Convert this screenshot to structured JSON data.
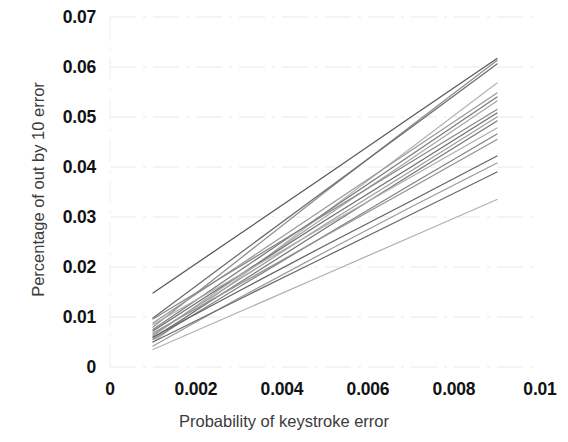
{
  "chart_data": {
    "type": "line",
    "title": "",
    "xlabel": "Probability of keystroke error",
    "ylabel": "Percentage of out by 10 error",
    "xlim": [
      0,
      0.01
    ],
    "ylim": [
      0,
      0.07
    ],
    "xticks": [
      "0",
      "0.002",
      "0.004",
      "0.006",
      "0.008",
      "0.01"
    ],
    "xtick_values": [
      0,
      0.002,
      0.004,
      0.006,
      0.008,
      0.01
    ],
    "yticks": [
      "0",
      "0.01",
      "0.02",
      "0.03",
      "0.04",
      "0.05",
      "0.06",
      "0.07"
    ],
    "ytick_values": [
      0,
      0.01,
      0.02,
      0.03,
      0.04,
      0.05,
      0.06,
      0.07
    ],
    "grid": true,
    "grid_color": "#e8e8e8",
    "legend": "none",
    "x": [
      0.001,
      0.003,
      0.005,
      0.007,
      0.009
    ],
    "series": [
      {
        "name": "series-1",
        "color": "#5a5a5a",
        "values": [
          0.0148,
          0.0265,
          0.0382,
          0.05,
          0.0617
        ]
      },
      {
        "name": "series-2",
        "color": "#8e8e8e",
        "values": [
          0.008,
          0.0215,
          0.035,
          0.0482,
          0.0613
        ]
      },
      {
        "name": "series-3",
        "color": "#6e6e6e",
        "values": [
          0.0098,
          0.0226,
          0.0353,
          0.0479,
          0.0606
        ]
      },
      {
        "name": "series-4",
        "color": "#b4b4b4",
        "values": [
          0.005,
          0.0178,
          0.0308,
          0.0438,
          0.0568
        ]
      },
      {
        "name": "series-5",
        "color": "#9a9a9a",
        "values": [
          0.0088,
          0.0203,
          0.0318,
          0.0433,
          0.0548
        ]
      },
      {
        "name": "series-6",
        "color": "#7c7c7c",
        "values": [
          0.0075,
          0.0192,
          0.0308,
          0.0424,
          0.054
        ]
      },
      {
        "name": "series-7",
        "color": "#a6a6a6",
        "values": [
          0.0062,
          0.0182,
          0.03,
          0.0416,
          0.0532
        ]
      },
      {
        "name": "series-8",
        "color": "#888888",
        "values": [
          0.0096,
          0.02,
          0.0305,
          0.041,
          0.0515
        ]
      },
      {
        "name": "series-9",
        "color": "#707070",
        "values": [
          0.0072,
          0.0183,
          0.0293,
          0.04,
          0.0508
        ]
      },
      {
        "name": "series-10",
        "color": "#9e9e9e",
        "values": [
          0.0065,
          0.0175,
          0.0285,
          0.0392,
          0.05
        ]
      },
      {
        "name": "series-11",
        "color": "#787878",
        "values": [
          0.0058,
          0.0168,
          0.0277,
          0.0385,
          0.0492
        ]
      },
      {
        "name": "series-12",
        "color": "#aeaeae",
        "values": [
          0.0085,
          0.0183,
          0.0282,
          0.038,
          0.0478
        ]
      },
      {
        "name": "series-13",
        "color": "#848484",
        "values": [
          0.0055,
          0.016,
          0.0263,
          0.0365,
          0.0466
        ]
      },
      {
        "name": "series-14",
        "color": "#929292",
        "values": [
          0.0068,
          0.0165,
          0.0262,
          0.0358,
          0.0455
        ]
      },
      {
        "name": "series-15",
        "color": "#646464",
        "values": [
          0.006,
          0.0152,
          0.0243,
          0.0332,
          0.0422
        ]
      },
      {
        "name": "series-16",
        "color": "#9c9c9c",
        "values": [
          0.0042,
          0.0138,
          0.023,
          0.032,
          0.0408
        ]
      },
      {
        "name": "series-17",
        "color": "#6a6a6a",
        "values": [
          0.005,
          0.0135,
          0.022,
          0.0305,
          0.039
        ]
      },
      {
        "name": "series-18",
        "color": "#b0b0b0",
        "values": [
          0.0035,
          0.011,
          0.0185,
          0.026,
          0.0335
        ]
      }
    ]
  }
}
